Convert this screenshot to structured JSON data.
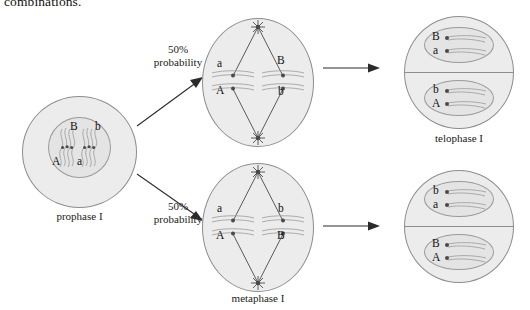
{
  "figure": {
    "top_text": "combinations.",
    "type": "meiosis-independent-assortment-diagram"
  },
  "colors": {
    "cell_fill": "#ececec",
    "cell_stroke": "#8d8d8d",
    "nucleus_fill": "#e4e4e4",
    "nucleus_stroke": "#9a9a9a",
    "chromosome": "#9e9e9e",
    "centromere": "#4a4a4a",
    "spindle": "#4a4a4a",
    "arrow": "#2b2b2b",
    "text": "#1a1a1a"
  },
  "stages": {
    "prophase": {
      "label": "prophase I",
      "alleles": {
        "top_left": "B",
        "top_right": "b",
        "bottom_left": "A",
        "bottom_right": "a"
      }
    },
    "metaphase_top": {
      "label": "",
      "alleles": {
        "left_upper": "a",
        "left_lower": "A",
        "right_upper": "B",
        "right_lower": "b"
      }
    },
    "metaphase_bottom": {
      "label": "metaphase I",
      "alleles": {
        "left_upper": "a",
        "left_lower": "A",
        "right_upper": "b",
        "right_lower": "B"
      }
    },
    "telophase_top": {
      "label": "telophase I",
      "upper_nucleus": {
        "upper": "B",
        "lower": "a"
      },
      "lower_nucleus": {
        "upper": "b",
        "lower": "A"
      }
    },
    "telophase_bottom": {
      "label": "",
      "upper_nucleus": {
        "upper": "b",
        "lower": "a"
      },
      "lower_nucleus": {
        "upper": "B",
        "lower": "A"
      }
    }
  },
  "branches": {
    "upper": {
      "probability": "50%",
      "caption": "probability"
    },
    "lower": {
      "probability": "50%",
      "caption": "probability"
    }
  }
}
